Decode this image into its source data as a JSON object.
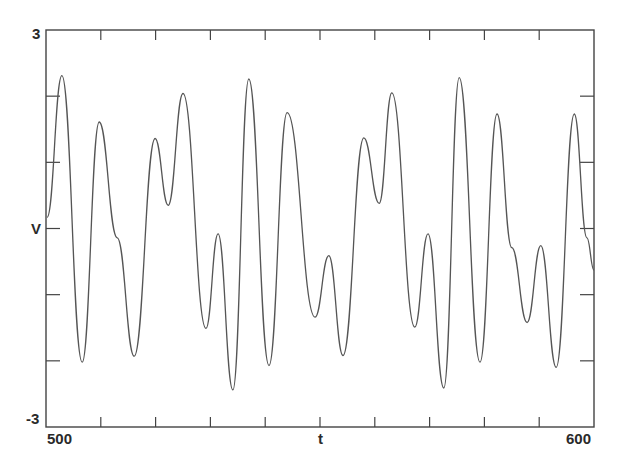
{
  "chart_data": {
    "type": "line",
    "title": "",
    "xlabel": "t",
    "ylabel": "V",
    "xlim": [
      500,
      600
    ],
    "ylim": [
      -3,
      3
    ],
    "x_tick_labels": [
      "500",
      "600"
    ],
    "y_tick_labels": [
      "3",
      "-3"
    ],
    "x_ticks": [
      500,
      510,
      520,
      530,
      540,
      550,
      560,
      570,
      580,
      590,
      600
    ],
    "y_ticks": [
      -3,
      -2,
      -1,
      0,
      1,
      2,
      3
    ],
    "grid": false,
    "legend": null,
    "line_color": "#555555",
    "series": [
      {
        "name": "V(t)",
        "points": [
          [
            500.2,
            0.17
          ],
          [
            502.9,
            2.31
          ],
          [
            506.6,
            -2.02
          ],
          [
            509.7,
            1.61
          ],
          [
            513.0,
            -0.14
          ],
          [
            516.1,
            -1.93
          ],
          [
            519.9,
            1.36
          ],
          [
            522.3,
            0.35
          ],
          [
            525.0,
            2.04
          ],
          [
            529.2,
            -1.51
          ],
          [
            531.4,
            -0.08
          ],
          [
            534.1,
            -2.44
          ],
          [
            537.0,
            2.26
          ],
          [
            540.7,
            -2.07
          ],
          [
            544.0,
            1.75
          ],
          [
            549.1,
            -1.34
          ],
          [
            551.6,
            -0.41
          ],
          [
            554.2,
            -1.92
          ],
          [
            558.0,
            1.37
          ],
          [
            560.8,
            0.38
          ],
          [
            563.1,
            2.05
          ],
          [
            567.3,
            -1.49
          ],
          [
            569.7,
            -0.08
          ],
          [
            572.6,
            -2.41
          ],
          [
            575.4,
            2.28
          ],
          [
            579.2,
            -2.02
          ],
          [
            582.3,
            1.73
          ],
          [
            585.0,
            -0.29
          ],
          [
            587.8,
            -1.42
          ],
          [
            590.3,
            -0.26
          ],
          [
            593.1,
            -2.1
          ],
          [
            596.4,
            1.73
          ],
          [
            598.7,
            -0.14
          ],
          [
            600.0,
            -0.63
          ]
        ]
      }
    ]
  },
  "labels": {
    "y_max": "3",
    "y_min": "-3",
    "y_axis": "V",
    "x_min": "500",
    "x_max": "600",
    "x_axis": "t"
  }
}
